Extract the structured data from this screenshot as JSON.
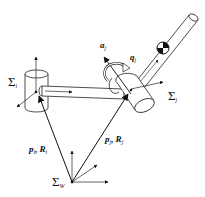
{
  "diagram": {
    "type": "robot-kinematics-frames",
    "colors": {
      "stroke": "#111111",
      "background": "#ffffff",
      "fill": "#ffffff"
    },
    "frames": [
      {
        "id": "world",
        "symbol": "Σ",
        "subscript": "W"
      },
      {
        "id": "i",
        "symbol": "Σ",
        "subscript": "i"
      },
      {
        "id": "j",
        "symbol": "Σ",
        "subscript": "j"
      }
    ],
    "vectors": [
      {
        "id": "to-i",
        "p": "p",
        "p_sub": "i",
        "R": "R",
        "R_sub": "i",
        "sep": ","
      },
      {
        "id": "to-j",
        "p": "p",
        "p_sub": "j",
        "R": "R",
        "R_sub": "j",
        "sep": ","
      }
    ],
    "joint": {
      "axis_label": "a",
      "axis_sub": "j",
      "angle_label": "q",
      "angle_sub": "j"
    }
  }
}
